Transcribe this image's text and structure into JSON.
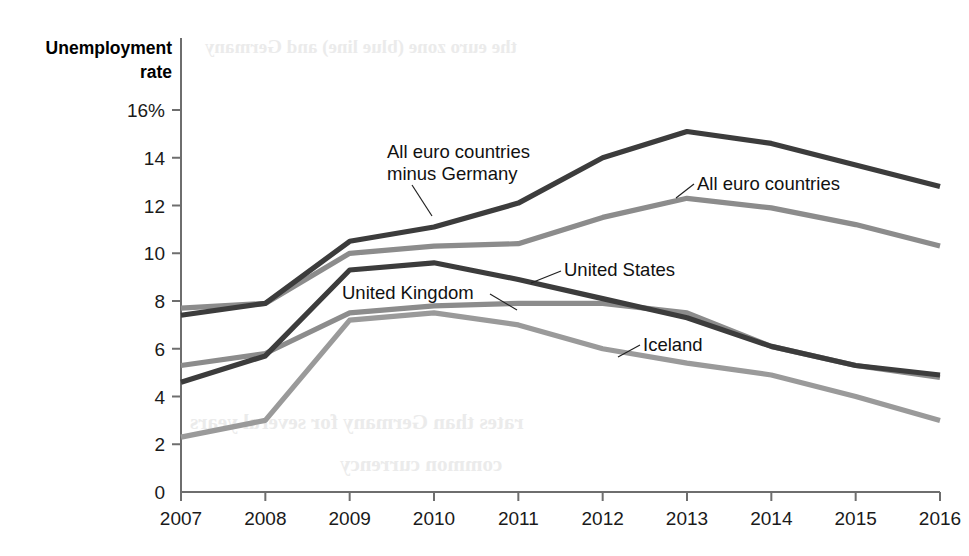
{
  "chart_data": {
    "type": "line",
    "title": "",
    "ylabel": "Unemployment rate",
    "xlabel": "",
    "x": [
      2007,
      2008,
      2009,
      2010,
      2011,
      2012,
      2013,
      2014,
      2015,
      2016
    ],
    "xtick_labels": [
      "2007",
      "2008",
      "2009",
      "2010",
      "2011",
      "2012",
      "2013",
      "2014",
      "2015",
      "2016"
    ],
    "ytick_labels": [
      "0",
      "2",
      "4",
      "6",
      "8",
      "10",
      "12",
      "14",
      "16%"
    ],
    "ytick_values": [
      0,
      2,
      4,
      6,
      8,
      10,
      12,
      14,
      16
    ],
    "ylim": [
      0,
      16
    ],
    "xlim": [
      2007,
      2016
    ],
    "grid": false,
    "legend": "annotations-inline",
    "series": [
      {
        "name": "All euro countries minus Germany",
        "color": "#3c3c3c",
        "values": [
          7.4,
          7.9,
          10.5,
          11.1,
          12.1,
          14.0,
          15.1,
          14.6,
          13.7,
          12.8
        ]
      },
      {
        "name": "All euro countries",
        "color": "#8c8c8c",
        "values": [
          7.7,
          7.9,
          10.0,
          10.3,
          10.4,
          11.5,
          12.3,
          11.9,
          11.2,
          10.3
        ]
      },
      {
        "name": "United States",
        "color": "#3c3c3c",
        "values": [
          4.6,
          5.7,
          9.3,
          9.6,
          8.9,
          8.1,
          7.3,
          6.1,
          5.3,
          4.9
        ]
      },
      {
        "name": "United Kingdom",
        "color": "#8c8c8c",
        "values": [
          5.3,
          5.8,
          7.5,
          7.8,
          7.9,
          7.9,
          7.5,
          6.1,
          5.3,
          4.8
        ]
      },
      {
        "name": "Iceland",
        "color": "#9a9a9a",
        "values": [
          2.3,
          3.0,
          7.2,
          7.5,
          7.0,
          6.0,
          5.4,
          4.9,
          4.0,
          3.0
        ]
      }
    ],
    "annotations": [
      {
        "id": "ann-euro-minus-germany",
        "lines": [
          "All euro countries",
          "minus Germany"
        ],
        "text_x": 387,
        "text_y": 158,
        "leader": "M 412 185 L 432 216"
      },
      {
        "id": "ann-all-euro",
        "lines": [
          "All euro countries"
        ],
        "text_x": 697,
        "text_y": 190,
        "leader": "M 694 184 L 676 198"
      },
      {
        "id": "ann-united-states",
        "lines": [
          "United States"
        ],
        "text_x": 564,
        "text_y": 276,
        "leader": "M 561 271 L 531 283"
      },
      {
        "id": "ann-united-kingdom",
        "lines": [
          "United Kingdom"
        ],
        "text_x": 342,
        "text_y": 299,
        "leader": "M 490 294 L 517 310"
      },
      {
        "id": "ann-iceland",
        "lines": [
          "Iceland"
        ],
        "text_x": 643,
        "text_y": 351,
        "leader": "M 640 345 L 618 357"
      }
    ],
    "ghost_texts": [
      {
        "text": "the euro zone (blue line) and Germany",
        "x": 205,
        "y": 36,
        "size": 19
      },
      {
        "text": "rates than Germany for several years",
        "x": 190,
        "y": 410,
        "size": 21
      },
      {
        "text": "common currency",
        "x": 340,
        "y": 452,
        "size": 21
      }
    ]
  }
}
